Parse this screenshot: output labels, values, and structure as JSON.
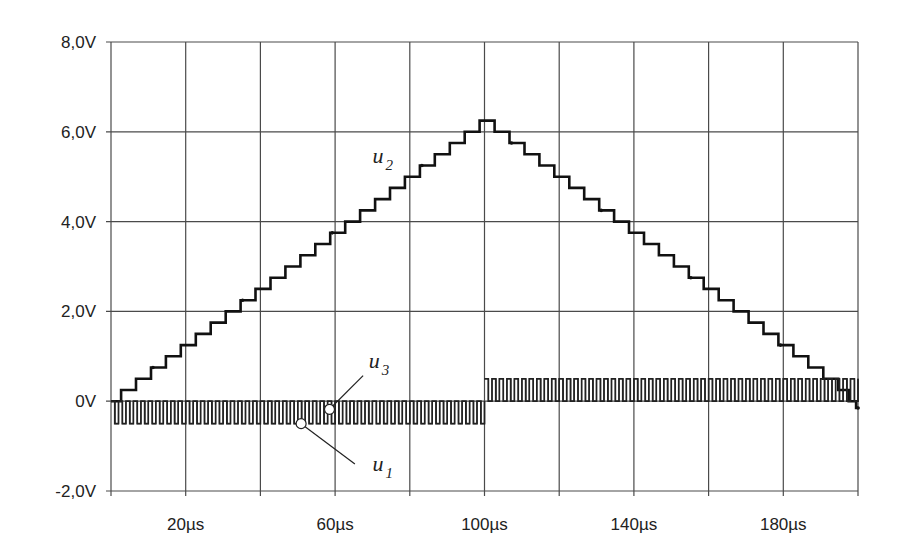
{
  "chart_data": {
    "type": "line",
    "title": "",
    "xlabel": "",
    "ylabel": "",
    "xlim": [
      0,
      200
    ],
    "ylim": [
      -2.0,
      8.0
    ],
    "x_unit": "µs",
    "y_unit": "V",
    "grid": true,
    "x_gridlines": [
      0,
      20,
      40,
      60,
      80,
      100,
      120,
      140,
      160,
      180,
      200
    ],
    "y_gridlines": [
      -2,
      0,
      2,
      4,
      6,
      8
    ],
    "x_tick_labels": [
      {
        "value": 20,
        "label": "20µs"
      },
      {
        "value": 60,
        "label": "60µs"
      },
      {
        "value": 100,
        "label": "100µs"
      },
      {
        "value": 140,
        "label": "140µs"
      },
      {
        "value": 180,
        "label": "180µs"
      }
    ],
    "y_tick_labels": [
      {
        "value": 8,
        "label": "8,0V"
      },
      {
        "value": 6,
        "label": "6,0V"
      },
      {
        "value": 4,
        "label": "4,0V"
      },
      {
        "value": 2,
        "label": "2,0V"
      },
      {
        "value": 0,
        "label": "0V"
      },
      {
        "value": -2,
        "label": "-2,0V"
      }
    ],
    "series": [
      {
        "name": "u2",
        "label_main": "u",
        "label_sub": "2",
        "style": "staircase",
        "step_height_V": 0.25,
        "step_duration_us": 4,
        "points": [
          [
            0,
            0
          ],
          [
            2.7,
            0.25
          ],
          [
            6.7,
            0.5
          ],
          [
            10.7,
            0.75
          ],
          [
            14.7,
            1.0
          ],
          [
            18.7,
            1.25
          ],
          [
            22.7,
            1.5
          ],
          [
            26.7,
            1.75
          ],
          [
            30.7,
            2.0
          ],
          [
            34.7,
            2.25
          ],
          [
            38.7,
            2.5
          ],
          [
            42.7,
            2.75
          ],
          [
            46.7,
            3.0
          ],
          [
            50.7,
            3.25
          ],
          [
            54.7,
            3.5
          ],
          [
            58.7,
            3.75
          ],
          [
            62.7,
            4.0
          ],
          [
            66.7,
            4.25
          ],
          [
            70.7,
            4.5
          ],
          [
            74.7,
            4.75
          ],
          [
            78.7,
            5.0
          ],
          [
            82.7,
            5.25
          ],
          [
            86.7,
            5.5
          ],
          [
            90.7,
            5.75
          ],
          [
            94.7,
            6.0
          ],
          [
            98.7,
            6.25
          ],
          [
            102.7,
            6.0
          ],
          [
            106.7,
            5.75
          ],
          [
            110.7,
            5.5
          ],
          [
            114.7,
            5.25
          ],
          [
            118.7,
            5.0
          ],
          [
            122.7,
            4.75
          ],
          [
            126.7,
            4.5
          ],
          [
            130.7,
            4.25
          ],
          [
            134.7,
            4.0
          ],
          [
            138.7,
            3.75
          ],
          [
            142.7,
            3.5
          ],
          [
            146.7,
            3.25
          ],
          [
            150.7,
            3.0
          ],
          [
            154.7,
            2.75
          ],
          [
            158.7,
            2.5
          ],
          [
            162.7,
            2.25
          ],
          [
            166.7,
            2.0
          ],
          [
            170.7,
            1.75
          ],
          [
            174.7,
            1.5
          ],
          [
            178.7,
            1.25
          ],
          [
            182.7,
            1.0
          ],
          [
            186.7,
            0.75
          ],
          [
            190.7,
            0.5
          ],
          [
            194.7,
            0.25
          ],
          [
            197.5,
            0.0
          ],
          [
            199.5,
            -0.15
          ],
          [
            200,
            -0.15
          ]
        ]
      },
      {
        "name": "u3",
        "label_main": "u",
        "label_sub": "3",
        "style": "square-wave",
        "period_us": 2.0,
        "segments": [
          {
            "t_start": 0,
            "t_end": 100,
            "low_V": -0.5,
            "high_V": 0.0
          },
          {
            "t_start": 100,
            "t_end": 200,
            "low_V": 0.0,
            "high_V": 0.5
          }
        ]
      },
      {
        "name": "u1",
        "label_main": "u",
        "label_sub": "1",
        "style": "square-wave",
        "period_us": 2.0,
        "segments": [
          {
            "t_start": 0,
            "t_end": 100,
            "low_V": -0.5,
            "high_V": 0.0
          },
          {
            "t_start": 100,
            "t_end": 200,
            "low_V": 0.0,
            "high_V": 0.5
          }
        ]
      }
    ],
    "annotations": [
      {
        "series": "u2",
        "text_main": "u",
        "text_sub": "2",
        "at": [
          70,
          5.3
        ]
      },
      {
        "series": "u3",
        "text_main": "u",
        "text_sub": "3",
        "at": [
          69,
          0.75
        ],
        "marker_at": [
          58.5,
          -0.18
        ],
        "leader_to": [
          67.5,
          0.57
        ]
      },
      {
        "series": "u1",
        "text_main": "u",
        "text_sub": "1",
        "at": [
          70,
          -1.55
        ],
        "marker_at": [
          50.9,
          -0.5
        ],
        "leader_to": [
          65.3,
          -1.4
        ]
      }
    ]
  }
}
